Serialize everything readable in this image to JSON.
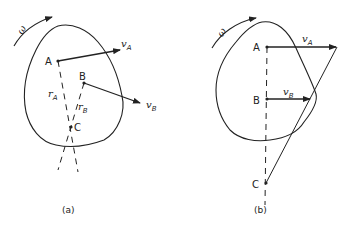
{
  "figure": {
    "panel_a": {
      "caption": "(a)",
      "omega": "ω",
      "points": [
        "A",
        "B",
        "C"
      ],
      "vectors": [
        {
          "label": "v",
          "sub": "A"
        },
        {
          "label": "v",
          "sub": "B"
        }
      ],
      "radii": [
        {
          "label": "r",
          "sub": "A"
        },
        {
          "label": "r",
          "sub": "B"
        }
      ]
    },
    "panel_b": {
      "caption": "(b)",
      "omega": "ω",
      "points": [
        "A",
        "B",
        "C"
      ],
      "vectors": [
        {
          "label": "v",
          "sub": "A"
        },
        {
          "label": "v",
          "sub": "B"
        }
      ]
    },
    "colors": {
      "stroke": "#222222",
      "background": "#ffffff"
    }
  }
}
